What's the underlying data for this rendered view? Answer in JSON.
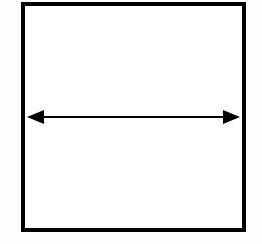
{
  "diagram": {
    "type": "square-with-double-arrow",
    "colors": {
      "background": "#fdfdfd",
      "square_fill": "#ffffff",
      "stroke": "#000000"
    },
    "square": {
      "x": 23,
      "y": 4,
      "width": 221,
      "height": 226,
      "stroke_width": 4
    },
    "arrow": {
      "direction": "horizontal-bidirectional",
      "y": 117,
      "x_start": 27,
      "x_end": 240,
      "line_width": 2,
      "head_length": 17,
      "head_half_height": 7
    }
  }
}
